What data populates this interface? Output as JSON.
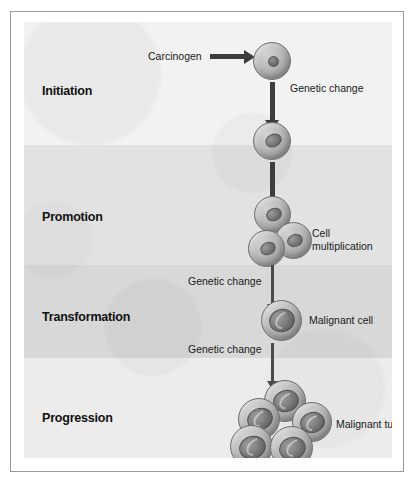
{
  "figure": {
    "background_color": "#efefef",
    "border_color": "#9a9a9a"
  },
  "stages": [
    {
      "id": "initiation",
      "label": "Initiation"
    },
    {
      "id": "promotion",
      "label": "Promotion"
    },
    {
      "id": "transformation",
      "label": "Transformation"
    },
    {
      "id": "progression",
      "label": "Progression"
    }
  ],
  "annotations": {
    "carcinogen": "Carcinogen",
    "genetic_change_1": "Genetic change",
    "cell_multiplication": "Cell multiplication",
    "genetic_change_2": "Genetic change",
    "malignant_cell": "Malignant cell",
    "genetic_change_3": "Genetic change",
    "malignant_tumor": "Malignant tumor"
  },
  "cells": {
    "normal_cell_count": 1,
    "initiated_cell_count": 1,
    "multiplied_cell_count": 3,
    "malignant_cell_count": 1,
    "tumor_cell_count": 5
  }
}
